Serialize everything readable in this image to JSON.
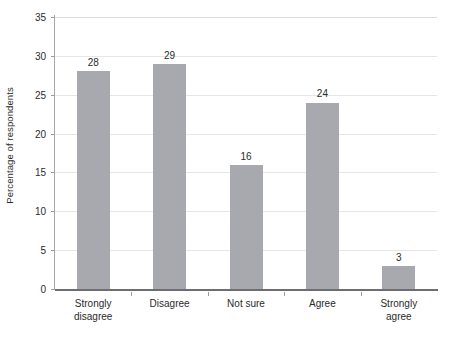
{
  "chart_data": {
    "type": "bar",
    "title": "",
    "subtitle": "",
    "xlabel": "",
    "ylabel": "Percentage of respondents",
    "categories": [
      "Strongly\ndisagree",
      "Disagree",
      "Not sure",
      "Agree",
      "Strongly agree"
    ],
    "values": [
      28,
      29,
      16,
      24,
      3
    ],
    "value_labels": [
      "28",
      "29",
      "16",
      "24",
      "3"
    ],
    "ylim": [
      0,
      35
    ],
    "ytick_values": [
      0,
      5,
      10,
      15,
      20,
      25,
      30,
      35
    ],
    "ytick_labels": [
      "0",
      "5",
      "10",
      "15",
      "20",
      "25",
      "30",
      "35"
    ],
    "grid": true,
    "grid_axis": "y",
    "legend": false,
    "legend_position": "none",
    "bar_color": "#a8a9ae",
    "grid_color": "#e6e6e8",
    "axis_color": "#6d6d72",
    "text_color": "#2b2b2b",
    "background": "#ffffff"
  },
  "axes": {
    "y_title": "Percentage of respondents"
  }
}
